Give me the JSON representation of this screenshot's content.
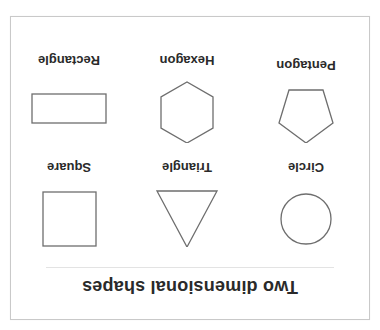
{
  "figure": {
    "title": "Two dimensional shapes",
    "orientation": "rotated 180 degrees",
    "stroke_color": "#6e6e6e",
    "text_color": "#2a2a2a",
    "border_color": "#c9c9c9",
    "shapes": [
      {
        "name": "Circle",
        "row": 1,
        "col": 1
      },
      {
        "name": "Triangle",
        "row": 1,
        "col": 2
      },
      {
        "name": "Square",
        "row": 1,
        "col": 3
      },
      {
        "name": "Pentagon",
        "row": 2,
        "col": 1
      },
      {
        "name": "Hexagon",
        "row": 2,
        "col": 2
      },
      {
        "name": "Rectangle",
        "row": 2,
        "col": 3
      }
    ]
  }
}
